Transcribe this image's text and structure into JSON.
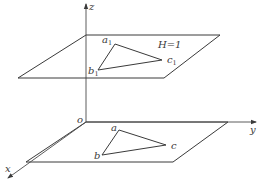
{
  "diagram": {
    "type": "3d-projection",
    "axes": {
      "origin_label": "o",
      "x_label": "x",
      "y_label": "y",
      "z_label": "z"
    },
    "upper_plane": {
      "label": "H=1",
      "triangle": {
        "vertices": [
          {
            "name": "a",
            "sub": "1"
          },
          {
            "name": "b",
            "sub": "1"
          },
          {
            "name": "c",
            "sub": "1"
          }
        ]
      }
    },
    "lower_plane": {
      "triangle": {
        "vertices": [
          {
            "name": "a"
          },
          {
            "name": "b"
          },
          {
            "name": "c"
          }
        ]
      }
    },
    "colors": {
      "stroke": "#3a3a3a",
      "background": "#ffffff"
    }
  }
}
